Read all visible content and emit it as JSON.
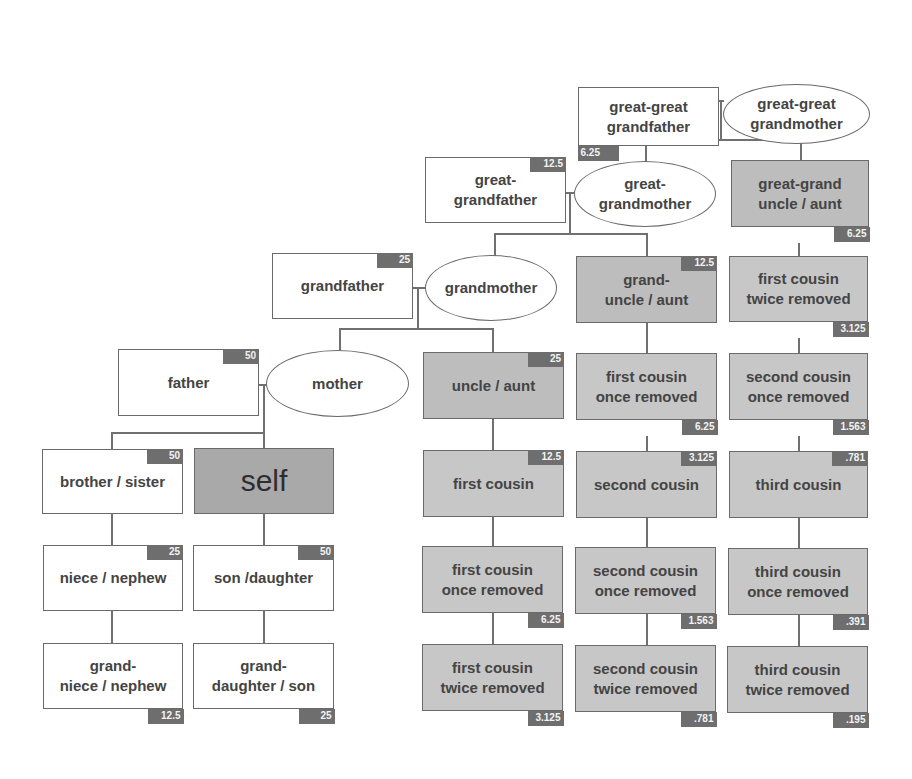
{
  "diagram": {
    "colors": {
      "border": "#6a6a6a",
      "badge_bg": "#6e6e6e",
      "blood_relative_fill": "#c7c7c7",
      "direct_line_fill": "#ffffff",
      "self_fill": "#a9a9a9"
    },
    "nodes": {
      "great_great_grandfather": {
        "label": "great-great\ngrandfather",
        "value": "6.25"
      },
      "great_great_grandmother": {
        "label": "great-great\ngrandmother"
      },
      "great_grandfather": {
        "label": "great-\ngrandfather",
        "value": "12.5"
      },
      "great_grandmother": {
        "label": "great-\ngrandmother"
      },
      "great_grand_uncle_aunt": {
        "label": "great-grand\nuncle / aunt",
        "value": "6.25"
      },
      "grandfather": {
        "label": "grandfather",
        "value": "25"
      },
      "grandmother": {
        "label": "grandmother"
      },
      "grand_uncle_aunt": {
        "label": "grand-\nuncle / aunt",
        "value": "12.5"
      },
      "first_cousin_twice_removed_up": {
        "label": "first cousin\ntwice removed",
        "value": "3.125"
      },
      "father": {
        "label": "father",
        "value": "50"
      },
      "mother": {
        "label": "mother"
      },
      "uncle_aunt": {
        "label": "uncle / aunt",
        "value": "25"
      },
      "first_cousin_once_removed_up": {
        "label": "first cousin\nonce removed",
        "value": "6.25"
      },
      "second_cousin_once_removed_up": {
        "label": "second cousin\nonce removed",
        "value": "1.563"
      },
      "brother_sister": {
        "label": "brother / sister",
        "value": "50"
      },
      "self": {
        "label": "self"
      },
      "first_cousin": {
        "label": "first cousin",
        "value": "12.5"
      },
      "second_cousin": {
        "label": "second cousin",
        "value": "3.125"
      },
      "third_cousin": {
        "label": "third cousin",
        "value": ".781"
      },
      "niece_nephew": {
        "label": "niece / nephew",
        "value": "25"
      },
      "son_daughter": {
        "label": "son /daughter",
        "value": "50"
      },
      "first_cousin_once_removed": {
        "label": "first cousin\nonce removed",
        "value": "6.25"
      },
      "second_cousin_once_removed": {
        "label": "second cousin\nonce removed",
        "value": "1.563"
      },
      "third_cousin_once_removed": {
        "label": "third cousin\nonce removed",
        "value": ".391"
      },
      "grand_niece_nephew": {
        "label": "grand-\nniece / nephew",
        "value": "12.5"
      },
      "grand_daughter_son": {
        "label": "grand-\ndaughter / son",
        "value": "25"
      },
      "first_cousin_twice_removed": {
        "label": "first cousin\ntwice removed",
        "value": "3.125"
      },
      "second_cousin_twice_removed": {
        "label": "second cousin\ntwice removed",
        "value": ".781"
      },
      "third_cousin_twice_removed": {
        "label": "third cousin\ntwice removed",
        "value": ".195"
      }
    }
  }
}
